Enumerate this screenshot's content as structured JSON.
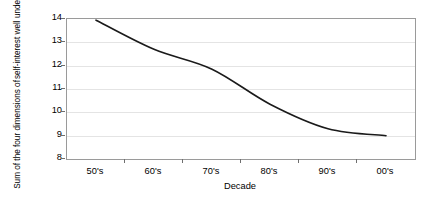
{
  "chart_data": {
    "type": "line",
    "title": "",
    "xlabel": "Decade",
    "ylabel": "Sum of the four dimensions of self-interest well understood",
    "ylabel_lines": [
      "Sum of the four dimensions of",
      "self-interest well understood"
    ],
    "categories": [
      "50's",
      "60's",
      "70's",
      "80's",
      "90's",
      "00's"
    ],
    "values": [
      13.95,
      12.7,
      11.85,
      10.35,
      9.3,
      9.0
    ],
    "x": [
      0,
      1,
      2,
      3,
      4,
      5
    ],
    "ylim": [
      8,
      14
    ],
    "yticks": [
      8,
      9,
      10,
      11,
      12,
      13,
      14
    ],
    "ytick_labels": [
      "8",
      "9",
      "10",
      "11",
      "12",
      "13",
      "14"
    ],
    "grid": true,
    "grid_axis": "y",
    "legend": false,
    "legend_position": "none",
    "series": [
      {
        "name": "Sum of the four dimensions of self-interest well understood",
        "color": "#1a1a1a",
        "values": [
          13.95,
          12.7,
          11.85,
          10.35,
          9.3,
          9.0
        ]
      }
    ],
    "annotations": [],
    "colors": {
      "line": "#1a1a1a",
      "gridline": "#e4e4e4",
      "axis": "#9a9a9a",
      "plot_background": "#ffffff",
      "text": "#000000"
    }
  }
}
